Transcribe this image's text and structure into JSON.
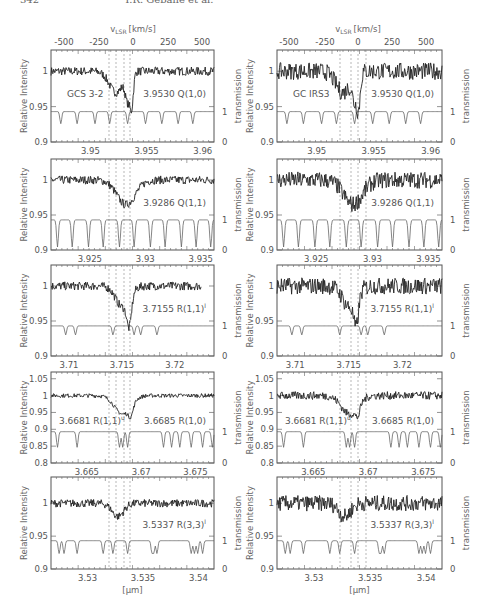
{
  "page_header": {
    "page_number": "342",
    "authors": "T.R. Geballe et al."
  },
  "figure": {
    "top_axis_label": "v",
    "top_axis_label_sub": "LSR",
    "top_axis_label_unit": "[km/s]",
    "top_axis_ticks": [
      "-500",
      "-250",
      "0",
      "250",
      "500"
    ],
    "left_axis_label": "Relative Intensity",
    "right_axis_label": "transmission",
    "bottom_axis_label": "[μm]",
    "columns": [
      {
        "source": "GCS 3-2"
      },
      {
        "source": "GC IRS3"
      }
    ]
  },
  "chart_data": [
    {
      "type": "line",
      "column": "GCS 3-2",
      "panel": 1,
      "line_label": "3.9530 Q(1,0)",
      "source_label": "GCS 3-2",
      "ylabel": "Relative Intensity",
      "ylim": [
        0.9,
        1.03
      ],
      "yticks": [
        "1",
        "0.95",
        "0.9"
      ],
      "xlim": [
        3.9465,
        3.961
      ],
      "xticks": [
        "3.95",
        "3.955",
        "3.96"
      ],
      "y2label": "transmission",
      "y2ticks": [
        "1",
        "0"
      ],
      "top_axis": {
        "label": "v_LSR [km/s]",
        "ticks": [
          -500,
          -250,
          0,
          250,
          500
        ]
      }
    },
    {
      "type": "line",
      "column": "GCS 3-2",
      "panel": 2,
      "line_label": "3.9286 Q(1,1)",
      "ylim": [
        0.9,
        1.03
      ],
      "yticks": [
        "1",
        "0.95",
        "0.9"
      ],
      "xlim": [
        3.9215,
        3.9362
      ],
      "xticks": [
        "3.925",
        "3.93",
        "3.935"
      ],
      "y2ticks": [
        "1",
        "0"
      ]
    },
    {
      "type": "line",
      "column": "GCS 3-2",
      "panel": 3,
      "line_label": "3.7155 R(1,1)",
      "line_label_sup": "l",
      "ylim": [
        0.9,
        1.03
      ],
      "yticks": [
        "1",
        "0.95",
        "0.9"
      ],
      "xlim": [
        3.7083,
        3.7237
      ],
      "xticks": [
        "3.71",
        "3.715",
        "3.72"
      ],
      "y2ticks": [
        "1",
        "0"
      ]
    },
    {
      "type": "line",
      "column": "GCS 3-2",
      "panel": 4,
      "line_label": "3.6685 R(1,0)",
      "line_label_2": "3.6681 R(1,1)",
      "line_label_2_sup": "u",
      "ylim": [
        0.8,
        1.07
      ],
      "yticks": [
        "1.05",
        "1",
        "0.95",
        "0.9",
        "0.85",
        "0.8"
      ],
      "xlim": [
        3.6617,
        3.6767
      ],
      "xticks": [
        "3.665",
        "3.67",
        "3.675"
      ],
      "y2ticks": [
        "1",
        "0"
      ]
    },
    {
      "type": "line",
      "column": "GCS 3-2",
      "panel": 5,
      "line_label": "3.5337 R(3,3)",
      "line_label_sup": "l",
      "ylim": [
        0.9,
        1.04
      ],
      "yticks": [
        "1",
        "0.95",
        "0.9"
      ],
      "xlim": [
        3.5267,
        3.5414
      ],
      "xticks": [
        "3.53",
        "3.535",
        "3.54"
      ],
      "y2ticks": [
        "1",
        "0"
      ],
      "xlabel": "[μm]"
    },
    {
      "type": "line",
      "column": "GC IRS3",
      "panel": 1,
      "line_label": "3.9530 Q(1,0)",
      "source_label": "GC IRS3",
      "ylim": [
        0.9,
        1.03
      ],
      "yticks": [
        "1",
        "0.95",
        "0.9"
      ],
      "xlim": [
        3.9465,
        3.961
      ],
      "xticks": [
        "3.95",
        "3.955",
        "3.96"
      ],
      "y2ticks": [
        "1",
        "0"
      ],
      "top_axis": {
        "label": "v_LSR [km/s]",
        "ticks": [
          -500,
          -250,
          0,
          250,
          500
        ]
      }
    },
    {
      "type": "line",
      "column": "GC IRS3",
      "panel": 2,
      "line_label": "3.9286 Q(1,1)",
      "ylim": [
        0.9,
        1.03
      ],
      "yticks": [
        "1",
        "0.95",
        "0.9"
      ],
      "xlim": [
        3.9215,
        3.9362
      ],
      "xticks": [
        "3.925",
        "3.93",
        "3.935"
      ],
      "y2ticks": [
        "1",
        "0"
      ]
    },
    {
      "type": "line",
      "column": "GC IRS3",
      "panel": 3,
      "line_label": "3.7155 R(1,1)",
      "line_label_sup": "l",
      "ylim": [
        0.9,
        1.03
      ],
      "yticks": [
        "1",
        "0.95",
        "0.9"
      ],
      "xlim": [
        3.7083,
        3.7237
      ],
      "xticks": [
        "3.71",
        "3.715",
        "3.72"
      ],
      "y2ticks": [
        "1",
        "0"
      ]
    },
    {
      "type": "line",
      "column": "GC IRS3",
      "panel": 4,
      "line_label": "3.6685 R(1,0)",
      "line_label_2": "3.6681 R(1,1)",
      "line_label_2_sup": "u",
      "ylim": [
        0.8,
        1.07
      ],
      "yticks": [
        "1.05",
        "1",
        "0.95",
        "0.9",
        "0.85",
        "0.8"
      ],
      "xlim": [
        3.6617,
        3.6767
      ],
      "xticks": [
        "3.665",
        "3.67",
        "3.675"
      ],
      "y2ticks": [
        "1",
        "0"
      ]
    },
    {
      "type": "line",
      "column": "GC IRS3",
      "panel": 5,
      "line_label": "3.5337 R(3,3)",
      "line_label_sup": "l",
      "ylim": [
        0.9,
        1.04
      ],
      "yticks": [
        "1",
        "0.95",
        "0.9"
      ],
      "xlim": [
        3.5267,
        3.5414
      ],
      "xticks": [
        "3.53",
        "3.535",
        "3.54"
      ],
      "y2ticks": [
        "1",
        "0"
      ],
      "xlabel": "[μm]"
    }
  ]
}
